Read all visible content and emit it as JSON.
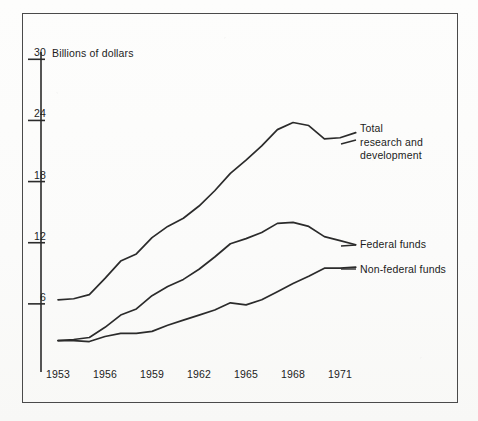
{
  "figure": {
    "axis_title": "Billions of dollars",
    "frame": {
      "x": 22,
      "y": 13,
      "width": 436,
      "height": 390
    }
  },
  "labels": {
    "total": "Total\nresearch and\ndevelopment",
    "federal": "Federal funds",
    "nonfederal": "Non-federal funds"
  },
  "axes": {
    "y_ticks": [
      "30",
      "24",
      "18",
      "12",
      "6"
    ],
    "y_tick_values": [
      30,
      24,
      18,
      12,
      6
    ],
    "x_ticks": [
      "1953",
      "1956",
      "1959",
      "1962",
      "1965",
      "1968",
      "1971"
    ],
    "x_tick_values": [
      1953,
      1956,
      1959,
      1962,
      1965,
      1968,
      1971
    ]
  },
  "chart_data": {
    "type": "line",
    "title": "",
    "subtitle": "",
    "xlabel": "",
    "ylabel": "Billions of dollars",
    "xlim": [
      1953,
      1972
    ],
    "ylim": [
      0,
      31
    ],
    "grid": false,
    "legend": "inline-right-of-series",
    "x": [
      1953,
      1954,
      1955,
      1956,
      1957,
      1958,
      1959,
      1960,
      1961,
      1962,
      1963,
      1964,
      1965,
      1966,
      1967,
      1968,
      1969,
      1970,
      1971,
      1972
    ],
    "series": [
      {
        "name": "Total research and development",
        "label": "Total research and development",
        "color": "#2b2b2b",
        "values": [
          6.4,
          6.5,
          6.9,
          8.5,
          10.2,
          10.9,
          12.5,
          13.6,
          14.4,
          15.6,
          17.1,
          18.8,
          20.1,
          21.5,
          23.1,
          23.8,
          23.5,
          22.2,
          22.3,
          22.8
        ]
      },
      {
        "name": "Federal funds",
        "label": "Federal funds",
        "color": "#2b2b2b",
        "values": [
          2.4,
          2.5,
          2.7,
          3.7,
          4.9,
          5.5,
          6.8,
          7.7,
          8.4,
          9.4,
          10.6,
          11.9,
          12.4,
          13.0,
          13.9,
          14.0,
          13.6,
          12.6,
          12.2,
          11.8
        ]
      },
      {
        "name": "Non-federal funds",
        "label": "Non-federal funds",
        "color": "#2b2b2b",
        "values": [
          2.4,
          2.4,
          2.3,
          2.8,
          3.1,
          3.1,
          3.3,
          3.9,
          4.4,
          4.9,
          5.4,
          6.1,
          5.9,
          6.4,
          7.2,
          8.0,
          8.7,
          9.5,
          9.5,
          9.6
        ]
      }
    ]
  }
}
